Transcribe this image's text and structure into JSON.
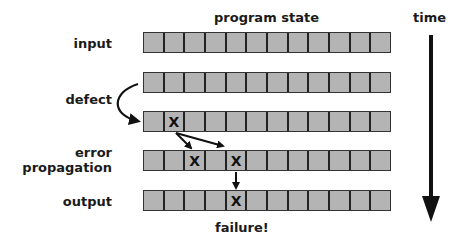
{
  "header": {
    "program_state": "program state",
    "time": "time"
  },
  "labels": {
    "input": "input",
    "defect": "defect",
    "error_line1": "error",
    "error_line2": "propagation",
    "output": "output",
    "failure": "failure!"
  },
  "grid": {
    "cells_per_row": 12,
    "rows": [
      {
        "name": "input",
        "marks": []
      },
      {
        "name": "pre-defect",
        "marks": []
      },
      {
        "name": "defect",
        "marks": [
          1
        ]
      },
      {
        "name": "propagation",
        "marks": [
          2,
          4
        ]
      },
      {
        "name": "output",
        "marks": [
          4
        ]
      }
    ],
    "mark_symbol": "X"
  },
  "colors": {
    "cell_fill": "#b4b4b4",
    "cell_border": "#222222",
    "arrow": "#111111"
  }
}
